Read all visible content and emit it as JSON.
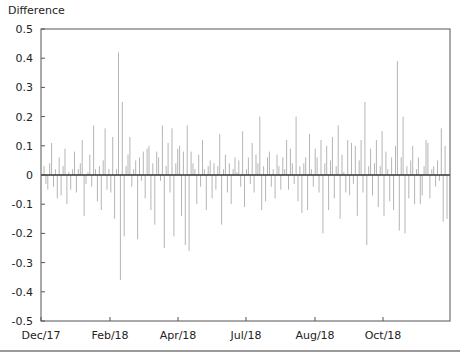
{
  "chart_data": {
    "type": "bar",
    "title": "",
    "xlabel": "",
    "ylabel": "Difference",
    "ylim": [
      -0.5,
      0.5
    ],
    "yticks": [
      0.5,
      0.4,
      0.3,
      0.2,
      0.1,
      0,
      -0.1,
      -0.2,
      -0.3,
      -0.4,
      -0.5
    ],
    "ytick_labels": [
      "0.5",
      "0.4",
      "0.3",
      "0.2",
      "0.1",
      "0",
      "-0.1",
      "-0.2",
      "-0.3",
      "-0.4",
      "-0.5"
    ],
    "xtick_labels": [
      "Dec/17",
      "Feb/18",
      "Apr/18",
      "Jul/18",
      "Aug/18",
      "Oct/18"
    ],
    "grid": false,
    "legend": null,
    "bar_color": "#b5b5b5",
    "zero_line_color": "#333333",
    "values": [
      0.03,
      -0.03,
      -0.05,
      0.04,
      0.11,
      -0.04,
      0.02,
      -0.08,
      0.06,
      -0.07,
      0.03,
      0.09,
      -0.1,
      0.01,
      -0.05,
      0.02,
      0.08,
      -0.06,
      0.02,
      0.04,
      0.12,
      -0.14,
      -0.03,
      0.01,
      0.07,
      -0.04,
      0.17,
      0.02,
      -0.09,
      0.03,
      -0.12,
      0.05,
      0.16,
      -0.05,
      0.02,
      -0.06,
      0.13,
      -0.15,
      0.02,
      0.42,
      -0.36,
      0.25,
      -0.21,
      0.03,
      0.07,
      0.13,
      -0.04,
      0.02,
      0.05,
      -0.22,
      0.06,
      -0.02,
      0.08,
      -0.08,
      0.09,
      0.1,
      -0.12,
      0.04,
      -0.17,
      0.08,
      0.06,
      -0.02,
      0.17,
      -0.25,
      0.03,
      0.11,
      -0.06,
      0.16,
      -0.21,
      0.04,
      0.09,
      0.1,
      -0.14,
      0.08,
      -0.24,
      0.17,
      -0.26,
      0.08,
      0.04,
      0.02,
      -0.1,
      0.07,
      -0.04,
      0.12,
      0.02,
      -0.12,
      0.03,
      0.05,
      -0.08,
      0.04,
      -0.05,
      0.03,
      0.14,
      -0.17,
      0.02,
      0.07,
      -0.06,
      0.04,
      -0.1,
      0.02,
      0.06,
      0.01,
      0.05,
      -0.04,
      0.15,
      -0.11,
      0.02,
      0.06,
      -0.03,
      0.11,
      -0.06,
      0.07,
      0.04,
      0.2,
      -0.12,
      0.03,
      -0.09,
      0.06,
      0.08,
      -0.04,
      0.02,
      -0.08,
      0.07,
      0.03,
      -0.05,
      0.06,
      0.02,
      0.12,
      -0.05,
      0.09,
      0.04,
      -0.03,
      0.2,
      -0.09,
      0.03,
      -0.13,
      0.04,
      0.06,
      -0.12,
      0.14,
      0.02,
      -0.04,
      0.09,
      0.06,
      -0.06,
      0.12,
      -0.2,
      0.04,
      0.1,
      -0.12,
      0.05,
      0.13,
      -0.08,
      0.03,
      0.17,
      -0.15,
      0.07,
      0.01,
      -0.06,
      0.12,
      -0.07,
      0.11,
      -0.03,
      0.1,
      -0.14,
      0.05,
      0.12,
      -0.06,
      0.25,
      -0.24,
      0.03,
      0.09,
      -0.07,
      0.04,
      0.12,
      -0.11,
      0.03,
      0.15,
      -0.14,
      0.08,
      0.02,
      -0.09,
      0.06,
      -0.12,
      0.1,
      0.39,
      -0.19,
      0.06,
      0.2,
      -0.2,
      0.03,
      -0.08,
      0.05,
      0.1,
      -0.1,
      0.02,
      0.06,
      -0.1,
      -0.07,
      0.03,
      0.12,
      0.11,
      -0.08,
      0.02,
      0.03,
      -0.04,
      0.05,
      -0.02,
      0.16,
      -0.16,
      0.1,
      -0.15
    ]
  },
  "axis": {
    "y_title": "Difference"
  }
}
